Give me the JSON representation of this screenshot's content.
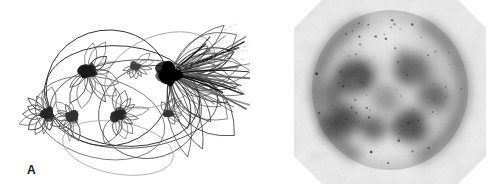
{
  "figure": {
    "background_color": "#ffffff",
    "width": 499,
    "height": 194,
    "panel_count": 2
  },
  "panels": [
    {
      "id": "panel-a",
      "label": "A",
      "label_position": {
        "x": 27,
        "y": 164
      },
      "type": "line-drawing",
      "description": "Ink line tracing of looped filament bundles radiating from dark focal nodes, enclosed by overlapping large ellipses",
      "ink_color": "#111111",
      "faint_trace_color": "#b9b9b9",
      "bounds": {
        "x": 0,
        "y": 0,
        "width": 250,
        "height": 194
      },
      "enclosing_ellipses": [
        {
          "cx": 108,
          "cy": 88,
          "rx": 62,
          "ry": 58,
          "rotate": -8,
          "stroke": "#2a2a2a",
          "width": 0.9
        },
        {
          "cx": 122,
          "cy": 96,
          "rx": 78,
          "ry": 50,
          "rotate": 6,
          "stroke": "#2a2a2a",
          "width": 0.9
        },
        {
          "cx": 134,
          "cy": 104,
          "rx": 84,
          "ry": 44,
          "rotate": -4,
          "stroke": "#3a3a3a",
          "width": 0.8
        },
        {
          "cx": 100,
          "cy": 118,
          "rx": 66,
          "ry": 40,
          "rotate": 14,
          "stroke": "#555555",
          "width": 0.7
        },
        {
          "cx": 150,
          "cy": 112,
          "rx": 52,
          "ry": 46,
          "rotate": -18,
          "stroke": "#4a4a4a",
          "width": 0.8
        },
        {
          "cx": 118,
          "cy": 148,
          "rx": 56,
          "ry": 26,
          "rotate": 10,
          "stroke": "#9a9a9a",
          "width": 0.7
        },
        {
          "cx": 160,
          "cy": 70,
          "rx": 58,
          "ry": 34,
          "rotate": -22,
          "stroke": "#8f8f8f",
          "width": 0.7
        }
      ],
      "nodes": [
        {
          "name": "node-left",
          "cx": 47,
          "cy": 114,
          "size": 7,
          "darkness": 0.85,
          "lobes": 11,
          "lobe_len": 26,
          "spread": 200,
          "dir": 180
        },
        {
          "name": "node-left-inner",
          "cx": 72,
          "cy": 117,
          "size": 6,
          "darkness": 0.8,
          "lobes": 10,
          "lobe_len": 22,
          "spread": 190,
          "dir": 170
        },
        {
          "name": "node-upper-left",
          "cx": 88,
          "cy": 72,
          "size": 8,
          "darkness": 0.9,
          "lobes": 12,
          "lobe_len": 34,
          "spread": 220,
          "dir": 30
        },
        {
          "name": "node-center",
          "cx": 118,
          "cy": 115,
          "size": 7,
          "darkness": 0.85,
          "lobes": 11,
          "lobe_len": 28,
          "spread": 210,
          "dir": 10
        },
        {
          "name": "node-upper-mid",
          "cx": 135,
          "cy": 66,
          "size": 5,
          "darkness": 0.75,
          "lobes": 9,
          "lobe_len": 18,
          "spread": 200,
          "dir": 60
        },
        {
          "name": "node-right-burst",
          "cx": 170,
          "cy": 74,
          "size": 13,
          "darkness": 1.0,
          "lobes": 22,
          "lobe_len": 78,
          "spread": 120,
          "dir": 18
        },
        {
          "name": "node-lower-right",
          "cx": 168,
          "cy": 113,
          "size": 5,
          "darkness": 0.8,
          "lobes": 8,
          "lobe_len": 16,
          "spread": 180,
          "dir": 330
        }
      ],
      "ray_bundle": {
        "origin": {
          "x": 170,
          "y": 74
        },
        "count": 26,
        "angle_start": -42,
        "angle_end": 34,
        "length_min": 46,
        "length_max": 86
      }
    },
    {
      "id": "panel-b",
      "label": "B",
      "label_position": {
        "x": 301,
        "y": 164
      },
      "type": "grayscale-micrograph",
      "description": "Octagonal grayscale autoradiograph of a cell with dark stained blobs and paired crescent arcs at left and right margins",
      "bounds": {
        "x": 250,
        "y": 0,
        "width": 249,
        "height": 194
      },
      "octagon": {
        "cx": 390,
        "cy": 92,
        "half_width": 96,
        "half_height": 92,
        "bevel": 28,
        "fill": "#efefef"
      },
      "cell_disc": {
        "cx": 390,
        "cy": 90,
        "rx": 78,
        "ry": 80,
        "fill": "#c9c9c9"
      },
      "crescents": [
        {
          "name": "crescent-left",
          "cx": 390,
          "cy": 90,
          "r": 74,
          "start": 118,
          "end": 248,
          "thickness": 9,
          "darkness": 0.62
        },
        {
          "name": "crescent-right",
          "cx": 390,
          "cy": 90,
          "r": 74,
          "start": -62,
          "end": 66,
          "thickness": 9,
          "darkness": 0.6
        }
      ],
      "blobs": [
        {
          "name": "blob-upper-left",
          "cx": 356,
          "cy": 76,
          "rx": 19,
          "ry": 16,
          "darkness": 0.8
        },
        {
          "name": "blob-upper-right",
          "cx": 411,
          "cy": 70,
          "rx": 16,
          "ry": 15,
          "darkness": 0.76
        },
        {
          "name": "blob-mid-right",
          "cx": 434,
          "cy": 96,
          "rx": 14,
          "ry": 13,
          "darkness": 0.66
        },
        {
          "name": "blob-lower-left",
          "cx": 343,
          "cy": 120,
          "rx": 17,
          "ry": 15,
          "darkness": 0.78
        },
        {
          "name": "blob-lower-center",
          "cx": 374,
          "cy": 128,
          "rx": 12,
          "ry": 11,
          "darkness": 0.7
        },
        {
          "name": "blob-lower-right",
          "cx": 408,
          "cy": 126,
          "rx": 16,
          "ry": 15,
          "darkness": 0.78
        },
        {
          "name": "blob-mid-left",
          "cx": 331,
          "cy": 95,
          "rx": 12,
          "ry": 14,
          "darkness": 0.6
        },
        {
          "name": "blob-center-faint",
          "cx": 386,
          "cy": 98,
          "rx": 13,
          "ry": 12,
          "darkness": 0.45
        }
      ],
      "light_regions": [
        {
          "name": "light-top-cap",
          "cx": 388,
          "cy": 40,
          "rx": 34,
          "ry": 22,
          "lightness": 0.72
        },
        {
          "name": "light-bottom-cap",
          "cx": 386,
          "cy": 150,
          "rx": 30,
          "ry": 16,
          "lightness": 0.78
        },
        {
          "name": "light-center",
          "cx": 392,
          "cy": 100,
          "rx": 10,
          "ry": 9,
          "lightness": 0.4
        }
      ],
      "speckles": 70
    }
  ]
}
